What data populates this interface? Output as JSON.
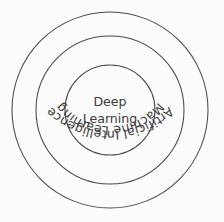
{
  "diagram": {
    "type": "concentric-circles",
    "background_color": "#fbfbfb",
    "stroke_color": "#4a4a4a",
    "text_color": "#3c3c3c",
    "center": {
      "x": 110,
      "y": 110
    },
    "rings": [
      {
        "id": "outer",
        "label": "Artificial Intelligence",
        "level": 1,
        "radius": 98,
        "label_orientation": "curved-arc",
        "label_arc_radius": 84
      },
      {
        "id": "middle",
        "label": "Machine Learning",
        "level": 2,
        "radius": 74,
        "label_orientation": "curved-arc",
        "label_arc_radius": 60
      },
      {
        "id": "inner",
        "label": "Deep Learning",
        "level": 3,
        "radius": 45,
        "label_orientation": "horizontal",
        "label_lines": [
          "Deep",
          "Learning"
        ]
      }
    ]
  },
  "labels": {
    "outer_ring": "Artificial Intelligence",
    "middle_ring": "Machine Learning",
    "inner_line_1": "Deep",
    "inner_line_2": "Learning"
  }
}
